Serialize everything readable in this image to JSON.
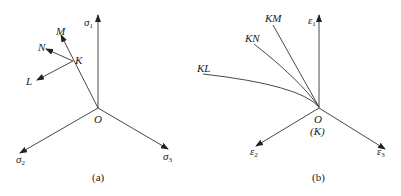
{
  "figure_a": {
    "caption": "(a)",
    "origin_label": "O",
    "axes": [
      {
        "symbol": "σ",
        "subscript": "1"
      },
      {
        "symbol": "σ",
        "subscript": "2"
      },
      {
        "symbol": "σ",
        "subscript": "3"
      }
    ],
    "point_label": "K",
    "path_labels": [
      "M",
      "N",
      "L"
    ]
  },
  "figure_b": {
    "caption": "(b)",
    "origin_label": "O",
    "origin_sub_label": "(K)",
    "axes": [
      {
        "symbol": "ε",
        "subscript": "1"
      },
      {
        "symbol": "ε",
        "subscript": "2"
      },
      {
        "symbol": "ε",
        "subscript": "3"
      }
    ],
    "curve_labels": [
      "KM",
      "KN",
      "KL"
    ]
  },
  "colors": {
    "line": "#333333",
    "text": "#222222",
    "background": "#ffffff"
  }
}
